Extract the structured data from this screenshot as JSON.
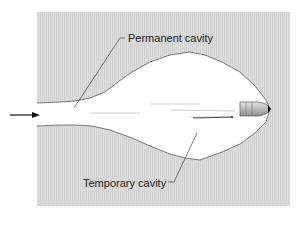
{
  "diagram": {
    "labels": {
      "permanent_cavity": "Permanent cavity",
      "temporary_cavity": "Temporary cavity"
    },
    "elements": {
      "projectile": "bullet",
      "direction_arrow": "arrow-right"
    },
    "colors": {
      "tissue_background": "#dadada",
      "cavity": "#ffffff",
      "outline": "#555555",
      "bullet": "#bdbdbd"
    }
  }
}
